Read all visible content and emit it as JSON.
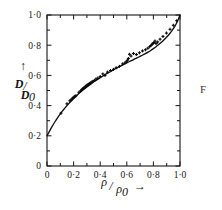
{
  "figure": {
    "corner_mark": "F",
    "background_color": "#ffffff",
    "ink_color": "#141414"
  },
  "chart_data": {
    "type": "scatter",
    "title": "",
    "subtitle": "",
    "xlabel": "ρ/ρ₀ →",
    "ylabel": "D/D₀",
    "xlabel_parts": {
      "numerator": "ρ",
      "slash": "/",
      "denominator": "ρ",
      "subscript": "0",
      "arrow": "→"
    },
    "ylabel_parts": {
      "numerator": "D",
      "slash": "/",
      "denominator": "D",
      "subscript": "0",
      "arrow": "↑"
    },
    "xlim": [
      0,
      1.0
    ],
    "ylim": [
      0,
      1.0
    ],
    "grid": false,
    "legend": false,
    "decimal_separator": "·",
    "x_ticks_major": [
      0,
      0.2,
      0.4,
      0.6,
      0.8,
      1.0
    ],
    "x_ticks_minor": [
      0.1,
      0.3,
      0.5,
      0.7,
      0.9
    ],
    "y_ticks_major": [
      0,
      0.2,
      0.4,
      0.6,
      0.8,
      1.0
    ],
    "y_ticks_minor": [
      0.1,
      0.3,
      0.5,
      0.7,
      0.9
    ],
    "x_tick_labels": [
      "0",
      "0·2",
      "0·4",
      "0·6",
      "0·8",
      "1·0"
    ],
    "y_tick_labels": [
      "0",
      "0·2",
      "0·4",
      "0·6",
      "0·8",
      "1·0"
    ],
    "series": [
      {
        "name": "fitted curve",
        "type": "line",
        "x": [
          0.0,
          0.02,
          0.04,
          0.06,
          0.08,
          0.1,
          0.12,
          0.14,
          0.16,
          0.18,
          0.2,
          0.22,
          0.24,
          0.26,
          0.28,
          0.3,
          0.32,
          0.34,
          0.36,
          0.38,
          0.4,
          0.42,
          0.44,
          0.46,
          0.48,
          0.5,
          0.52,
          0.54,
          0.56,
          0.58,
          0.6,
          0.62,
          0.64,
          0.66,
          0.68,
          0.7,
          0.72,
          0.74,
          0.76,
          0.78,
          0.8,
          0.82,
          0.84,
          0.86,
          0.88,
          0.9,
          0.92,
          0.94,
          0.96,
          0.98,
          1.0
        ],
        "y": [
          0.2,
          0.233,
          0.264,
          0.293,
          0.32,
          0.345,
          0.368,
          0.39,
          0.41,
          0.429,
          0.447,
          0.464,
          0.48,
          0.495,
          0.51,
          0.524,
          0.537,
          0.55,
          0.562,
          0.574,
          0.585,
          0.596,
          0.607,
          0.617,
          0.627,
          0.637,
          0.647,
          0.656,
          0.665,
          0.674,
          0.683,
          0.692,
          0.7,
          0.709,
          0.717,
          0.726,
          0.735,
          0.744,
          0.754,
          0.765,
          0.777,
          0.79,
          0.804,
          0.819,
          0.836,
          0.854,
          0.874,
          0.897,
          0.923,
          0.957,
          1.0
        ]
      },
      {
        "name": "measured points",
        "type": "scatter",
        "marker": "cross",
        "x": [
          0.105,
          0.15,
          0.172,
          0.182,
          0.19,
          0.196,
          0.203,
          0.21,
          0.218,
          0.24,
          0.252,
          0.258,
          0.264,
          0.27,
          0.276,
          0.282,
          0.288,
          0.294,
          0.3,
          0.306,
          0.312,
          0.318,
          0.324,
          0.33,
          0.338,
          0.346,
          0.356,
          0.368,
          0.382,
          0.4,
          0.42,
          0.436,
          0.455,
          0.478,
          0.5,
          0.52,
          0.545,
          0.568,
          0.585,
          0.596,
          0.604,
          0.612,
          0.62,
          0.632,
          0.65,
          0.672,
          0.695,
          0.718,
          0.74,
          0.758,
          0.772,
          0.782,
          0.79,
          0.797,
          0.804,
          0.812,
          0.82,
          0.832,
          0.85,
          0.872,
          0.898,
          0.925,
          0.95,
          0.975
        ],
        "y": [
          0.35,
          0.412,
          0.432,
          0.438,
          0.446,
          0.452,
          0.455,
          0.462,
          0.466,
          0.488,
          0.497,
          0.5,
          0.508,
          0.512,
          0.516,
          0.52,
          0.524,
          0.53,
          0.534,
          0.537,
          0.54,
          0.545,
          0.548,
          0.552,
          0.556,
          0.562,
          0.566,
          0.576,
          0.582,
          0.592,
          0.61,
          0.6,
          0.622,
          0.632,
          0.64,
          0.65,
          0.66,
          0.676,
          0.682,
          0.69,
          0.7,
          0.712,
          0.74,
          0.728,
          0.745,
          0.738,
          0.75,
          0.762,
          0.77,
          0.78,
          0.79,
          0.798,
          0.806,
          0.812,
          0.818,
          0.828,
          0.812,
          0.822,
          0.84,
          0.858,
          0.88,
          0.905,
          0.932,
          0.962
        ]
      }
    ]
  }
}
